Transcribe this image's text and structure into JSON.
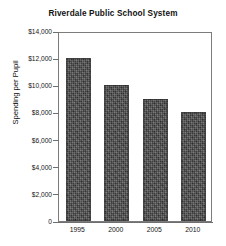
{
  "chart_data": {
    "type": "bar",
    "title": "Riverdale Public School System",
    "xlabel": "",
    "ylabel": "Spending per Pupil",
    "categories": [
      "1995",
      "2000",
      "2005",
      "2010"
    ],
    "values": [
      12000,
      10000,
      9000,
      8000
    ],
    "ylim": [
      0,
      14000
    ],
    "ytick_values": [
      0,
      2000,
      4000,
      6000,
      8000,
      10000,
      12000,
      14000
    ],
    "ytick_labels": [
      "0",
      "$2,000",
      "$4,000",
      "$6,000",
      "$8,000",
      "$10,000",
      "$12,000",
      "$14,000"
    ],
    "grid": false,
    "legend": null,
    "bar_color": "#4b4b4b",
    "frame_color": "#7c7c7c",
    "background": "#ffffff"
  }
}
